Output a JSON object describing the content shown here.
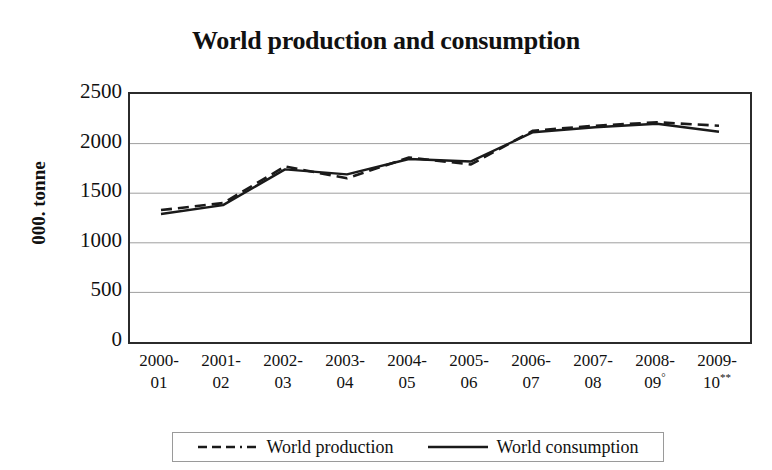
{
  "chart_data": {
    "type": "line",
    "title": "World production and consumption",
    "xlabel": "",
    "ylabel": "000. tonne",
    "ylim": [
      0,
      2500
    ],
    "yticks": [
      2500,
      2000,
      1500,
      1000,
      500,
      0
    ],
    "grid": true,
    "legend_position": "bottom",
    "categories": [
      "2000-01",
      "2001-02",
      "2002-03",
      "2003-04",
      "2004-05",
      "2005-06",
      "2006-07",
      "2007-08",
      "2008-09°",
      "2009-10**"
    ],
    "category_lines": [
      [
        "2000-",
        "01"
      ],
      [
        "2001-",
        "02"
      ],
      [
        "2002-",
        "03"
      ],
      [
        "2003-",
        "04"
      ],
      [
        "2004-",
        "05"
      ],
      [
        "2005-",
        "06"
      ],
      [
        "2006-",
        "07"
      ],
      [
        "2007-",
        "08"
      ],
      [
        "2008-",
        "09°"
      ],
      [
        "2009-",
        "10**"
      ]
    ],
    "series": [
      {
        "name": "World production",
        "style": "dashed",
        "color": "#1a1a1a",
        "values": [
          1330,
          1400,
          1770,
          1650,
          1860,
          1790,
          2130,
          2180,
          2215,
          2180
        ]
      },
      {
        "name": "World consumption",
        "style": "solid",
        "color": "#1a1a1a",
        "values": [
          1290,
          1380,
          1740,
          1690,
          1845,
          1820,
          2115,
          2165,
          2200,
          2120
        ]
      }
    ]
  },
  "legend": {
    "entries": [
      {
        "label": "World production",
        "style": "dashed"
      },
      {
        "label": "World consumption",
        "style": "solid"
      }
    ]
  }
}
